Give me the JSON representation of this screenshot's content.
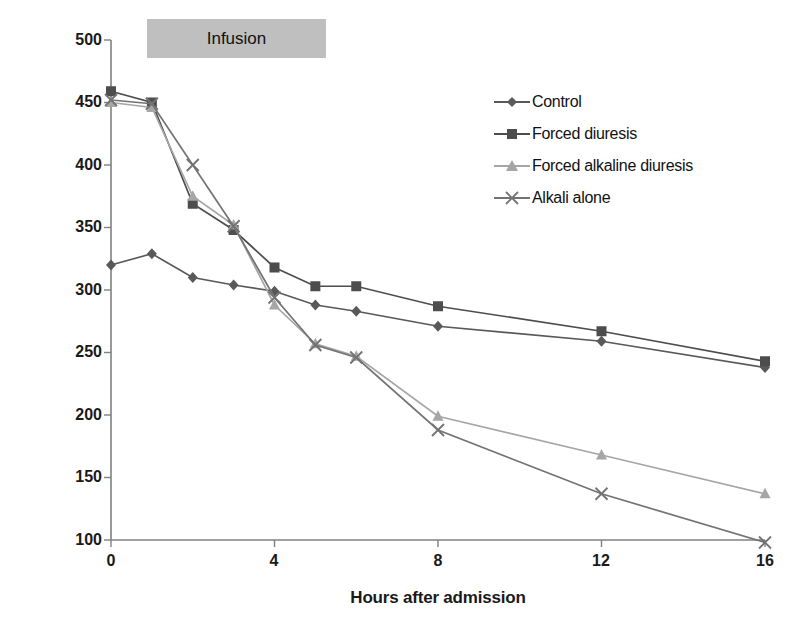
{
  "chart_data": {
    "type": "line",
    "title": "",
    "xlabel": "Hours after admission",
    "ylabel": "Plasma salicylic acid concentration (mg/l)",
    "xlim": [
      0,
      16
    ],
    "ylim": [
      100,
      500
    ],
    "xticks": [
      0,
      4,
      8,
      12,
      16
    ],
    "yticks": [
      100,
      150,
      200,
      250,
      300,
      350,
      400,
      450,
      500
    ],
    "grid": false,
    "legend_position": "upper-right-inside",
    "x": [
      0,
      1,
      2,
      3,
      4,
      5,
      6,
      8,
      12,
      16
    ],
    "series": [
      {
        "name": "Control",
        "marker": "diamond",
        "color": "#595959",
        "values": [
          320,
          329,
          310,
          304,
          299,
          288,
          283,
          271,
          259,
          238
        ]
      },
      {
        "name": "Forced diuresis",
        "marker": "square",
        "color": "#4d4d4d",
        "values": [
          459,
          450,
          369,
          348,
          318,
          303,
          303,
          287,
          267,
          243
        ]
      },
      {
        "name": "Forced alkaline diuresis",
        "marker": "triangle",
        "color": "#a6a6a6",
        "values": [
          450,
          446,
          375,
          352,
          288,
          257,
          247,
          199,
          168,
          137
        ]
      },
      {
        "name": "Alkali alone",
        "marker": "x",
        "color": "#737373",
        "values": [
          452,
          449,
          400,
          351,
          294,
          256,
          246,
          188,
          137,
          98
        ]
      }
    ],
    "annotations": [
      {
        "name": "infusion-band",
        "label": "Infusion",
        "x_start": 0.55,
        "x_end": 3.3,
        "background": "#bfbfbf"
      }
    ]
  },
  "axes": {
    "y_tick_labels": [
      "500",
      "450",
      "400",
      "350",
      "300",
      "250",
      "200",
      "150",
      "100"
    ],
    "x_tick_labels": [
      "0",
      "4",
      "8",
      "12",
      "16"
    ],
    "y_title": "Plasma salicylic acid concentration (mg/l)",
    "x_title": "Hours after admission",
    "axis_color": "#808080"
  },
  "legend": {
    "items": [
      {
        "label": "Control",
        "marker": "diamond-marker-icon",
        "color": "#595959"
      },
      {
        "label": "Forced diuresis",
        "marker": "square-marker-icon",
        "color": "#4d4d4d"
      },
      {
        "label": "Forced alkaline diuresis",
        "marker": "triangle-marker-icon",
        "color": "#a6a6a6"
      },
      {
        "label": "Alkali alone",
        "marker": "x-marker-icon",
        "color": "#737373"
      }
    ]
  },
  "banner": {
    "label": "Infusion"
  }
}
